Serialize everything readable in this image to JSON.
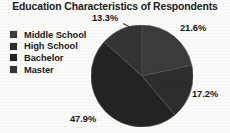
{
  "chart_data": {
    "type": "pie",
    "title": "Education Characteristics of Respondents",
    "subtitle": "",
    "xlabel": "",
    "ylabel": "",
    "legend_position": "left",
    "grid": false,
    "units": "percent",
    "categories": [
      "Middle School",
      "High School",
      "Bachelor",
      "Master"
    ],
    "values": [
      21.6,
      17.2,
      47.9,
      13.3
    ],
    "labels": [
      "21.6%",
      "17.2%",
      "47.9%",
      "13.3%"
    ],
    "slice_colors": [
      "#3b3b3b",
      "#2d2d2d",
      "#232323",
      "#343434"
    ],
    "start_angle_deg": 0,
    "direction": "clockwise",
    "slices": [
      {
        "name": "Middle School",
        "value": 21.6,
        "label": "21.6%",
        "color": "#3b3b3b"
      },
      {
        "name": "High School",
        "value": 17.2,
        "label": "17.2%",
        "color": "#2d2d2d"
      },
      {
        "name": "Bachelor",
        "value": 47.9,
        "label": "47.9%",
        "color": "#232323"
      },
      {
        "name": "Master",
        "value": 13.3,
        "label": "13.3%",
        "color": "#343434"
      }
    ]
  },
  "chart": {
    "title": "Education Characteristics of Respondents"
  },
  "legend": {
    "items": [
      {
        "label": "Middle School",
        "color": "#3b3b3b"
      },
      {
        "label": "High School",
        "color": "#2d2d2d"
      },
      {
        "label": "Bachelor",
        "color": "#232323"
      },
      {
        "label": "Master",
        "color": "#343434"
      }
    ]
  },
  "pie_labels": {
    "top_left": "13.3%",
    "top_right": "21.6%",
    "right": "17.2%",
    "bottom_left": "47.9%"
  }
}
